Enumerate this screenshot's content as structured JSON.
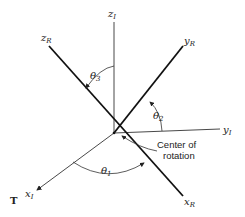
{
  "figure": {
    "type": "rotation-axes-diagram",
    "marker": "T",
    "axes": {
      "inertial": [
        {
          "name": "x",
          "subscript": "I"
        },
        {
          "name": "y",
          "subscript": "I"
        },
        {
          "name": "z",
          "subscript": "I"
        }
      ],
      "rotated": [
        {
          "name": "x",
          "subscript": "R"
        },
        {
          "name": "y",
          "subscript": "R"
        },
        {
          "name": "z",
          "subscript": "R"
        }
      ]
    },
    "angles": [
      {
        "symbol": "θ",
        "subscript": "1"
      },
      {
        "symbol": "θ",
        "subscript": "2"
      },
      {
        "symbol": "θ",
        "subscript": "3"
      }
    ],
    "annotation": {
      "line1": "Center of",
      "line2": "rotation"
    },
    "colors": {
      "ink": "#222222",
      "background": "#ffffff"
    }
  }
}
